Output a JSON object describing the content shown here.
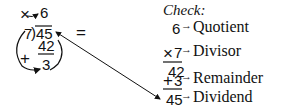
{
  "division": {
    "multiply_sign": "×",
    "quotient": "6",
    "divisor": "7",
    "bracket": ")",
    "dividend": "45",
    "plus_sign": "+",
    "product": "42",
    "remainder": "3",
    "equals": "="
  },
  "check": {
    "title": "Check:",
    "rows": [
      {
        "value": "6",
        "prefix": "",
        "arrow": "→",
        "label": "Quotient"
      },
      {
        "value": "7",
        "prefix": "×",
        "arrow": "→",
        "label": "Divisor"
      },
      {
        "value": "42",
        "prefix": "",
        "arrow": "",
        "label": ""
      },
      {
        "value": "3",
        "prefix": "+",
        "arrow": "→",
        "label": "Remainder"
      },
      {
        "value": "45",
        "prefix": "",
        "arrow": "→",
        "label": "Dividend"
      }
    ]
  },
  "colors": {
    "ink": "#111111",
    "background": "#ffffff"
  }
}
